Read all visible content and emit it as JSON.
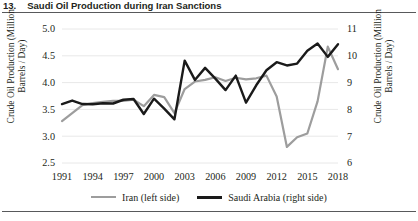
{
  "figure": {
    "number": "13.",
    "title": "Saudi Oil Production during Iran Sanctions"
  },
  "colors": {
    "iran": "#9d9d9d",
    "saudi": "#1a1a1a",
    "grid": "#e8e8e8",
    "text": "#231f20",
    "rule": "#58595b"
  },
  "legend": {
    "position": "bottom-center",
    "items": [
      {
        "key": "iran",
        "label": "Iran (left side)"
      },
      {
        "key": "saudi",
        "label": "Saudi Arabia (right side)"
      }
    ]
  },
  "chart_data": {
    "type": "line",
    "title": "Saudi Oil Production during Iran Sanctions",
    "xlabel": "",
    "ylabel": "Crude Oil Production (Million Barrels / Day)",
    "ylabel_right": "Crude Oil Production (Million Barrels / Day)",
    "grid": true,
    "dual_axis": true,
    "xlim": [
      1991,
      2018
    ],
    "xticks": [
      1991,
      1994,
      1997,
      2000,
      2003,
      2006,
      2009,
      2012,
      2015,
      2018
    ],
    "xticklabels": [
      "1991",
      "1994",
      "1997",
      "2000",
      "2003",
      "2006",
      "2009",
      "2012",
      "2015",
      "2018"
    ],
    "ylim": [
      2.5,
      5.0
    ],
    "yticks": [
      2.5,
      3.0,
      3.5,
      4.0,
      4.5,
      5.0
    ],
    "yticklabels": [
      "2.5",
      "3.0",
      "3.5",
      "4.0",
      "4.5",
      "5.0"
    ],
    "ylim_right": [
      6,
      11
    ],
    "yticks_right": [
      6,
      7,
      8,
      9,
      10,
      11
    ],
    "yticklabels_right": [
      "6",
      "7",
      "8",
      "9",
      "10",
      "11"
    ],
    "x": [
      1991,
      1992,
      1993,
      1994,
      1995,
      1996,
      1997,
      1998,
      1999,
      2000,
      2001,
      2002,
      2003,
      2004,
      2005,
      2006,
      2007,
      2008,
      2009,
      2010,
      2011,
      2012,
      2013,
      2014,
      2015,
      2016,
      2017,
      2018
    ],
    "series": [
      {
        "name": "Iran (left side)",
        "axis": "left",
        "color": "#9d9d9d",
        "values": [
          3.28,
          3.43,
          3.58,
          3.62,
          3.64,
          3.66,
          3.66,
          3.68,
          3.56,
          3.77,
          3.73,
          3.43,
          3.88,
          4.02,
          4.05,
          4.1,
          4.03,
          4.09,
          4.06,
          4.08,
          4.13,
          3.74,
          2.8,
          2.98,
          3.05,
          3.65,
          4.67,
          4.25
        ]
      },
      {
        "name": "Saudi Arabia (right side)",
        "axis": "right",
        "color": "#1a1a1a",
        "values": [
          8.2,
          8.33,
          8.2,
          8.19,
          8.23,
          8.22,
          8.36,
          8.39,
          7.83,
          8.4,
          8.03,
          7.63,
          9.82,
          9.1,
          9.55,
          9.15,
          8.72,
          9.26,
          8.25,
          8.9,
          9.46,
          9.76,
          9.64,
          9.71,
          10.19,
          10.46,
          9.96,
          10.43
        ]
      }
    ],
    "annotations": []
  }
}
